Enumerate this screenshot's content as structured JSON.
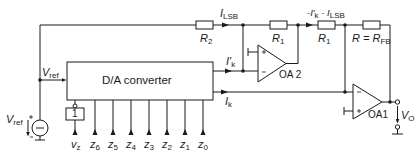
{
  "diagram": {
    "blocks": {
      "dac": {
        "label": "D/A converter"
      },
      "inverter": {
        "label": "1"
      },
      "opamp2": {
        "label": "OA 2",
        "plus": "+",
        "minus": "-"
      },
      "opamp1": {
        "label": "OA1",
        "plus": "+",
        "minus": "-"
      }
    },
    "resistors": {
      "r2": {
        "label": "R",
        "sub": "2"
      },
      "r1a": {
        "label": "R",
        "sub": "1"
      },
      "r1b": {
        "label": "R",
        "sub": "1"
      },
      "rfb": {
        "label": "R = R",
        "sub": "FB"
      }
    },
    "currents": {
      "i_lsb": {
        "label": "I",
        "sub": "LSB"
      },
      "i_k_prime": {
        "label": "I′",
        "sub": "k"
      },
      "i_k": {
        "label": "I",
        "sub": "k"
      },
      "i_sum": {
        "prefix": "-I′",
        "sub1": "k",
        "mid": " - I",
        "sub2": "LSB"
      }
    },
    "voltages": {
      "vref_node": {
        "label": "V",
        "sub": "ref"
      },
      "vref_source": {
        "label": "V",
        "sub": "ref"
      },
      "vo": {
        "label": "V",
        "sub": "O"
      }
    },
    "source_polarity": {
      "plus": "+",
      "minus": "−"
    },
    "inputs": [
      {
        "label": "v",
        "sub": "z"
      },
      {
        "label": "z",
        "sub": "6"
      },
      {
        "label": "z",
        "sub": "5"
      },
      {
        "label": "z",
        "sub": "4"
      },
      {
        "label": "z",
        "sub": "3"
      },
      {
        "label": "z",
        "sub": "2"
      },
      {
        "label": "z",
        "sub": "1"
      },
      {
        "label": "z",
        "sub": "0"
      }
    ],
    "colors": {
      "line": "#1a1a1a",
      "background": "#ffffff"
    }
  }
}
